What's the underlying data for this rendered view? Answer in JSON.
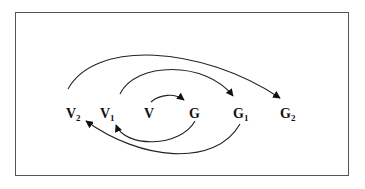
{
  "diagram": {
    "nodes": [
      {
        "id": "V2",
        "base": "V",
        "sub": "2",
        "x": 66,
        "y": 118
      },
      {
        "id": "V1",
        "base": "V",
        "sub": "1",
        "x": 100,
        "y": 118
      },
      {
        "id": "V",
        "base": "V",
        "sub": "",
        "x": 144,
        "y": 118
      },
      {
        "id": "G",
        "base": "G",
        "sub": "",
        "x": 189,
        "y": 118
      },
      {
        "id": "G1",
        "base": "G",
        "sub": "1",
        "x": 233,
        "y": 118
      },
      {
        "id": "G2",
        "base": "G",
        "sub": "2",
        "x": 280,
        "y": 118
      }
    ],
    "edges": [
      {
        "from": "V",
        "to": "G",
        "position": "above"
      },
      {
        "from": "V1",
        "to": "G1",
        "position": "above"
      },
      {
        "from": "V2",
        "to": "G2",
        "position": "above"
      },
      {
        "from": "G",
        "to": "V1",
        "position": "below"
      },
      {
        "from": "G1",
        "to": "V2",
        "position": "below"
      }
    ]
  }
}
